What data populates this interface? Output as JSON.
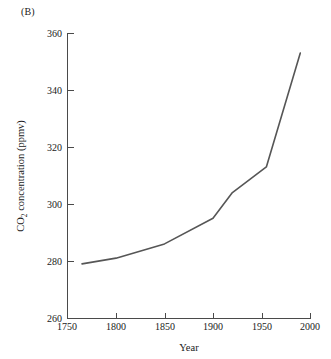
{
  "figure": {
    "panel_label": "(B)",
    "line_color": "#565656",
    "axis_color": "#4a4a4a",
    "background_color": "#ffffff"
  },
  "axes": {
    "y_label_prefix": "CO",
    "y_label_subscript": "2",
    "y_label_suffix": " concentration (ppmv)",
    "y_label_full": "CO2 concentration (ppmv)",
    "x_label": "Year",
    "y_ticks": [
      "260",
      "280",
      "300",
      "320",
      "340",
      "360"
    ],
    "x_ticks": [
      "1750",
      "1800",
      "1850",
      "1900",
      "1950",
      "2000"
    ]
  },
  "chart_data": {
    "type": "line",
    "title": "(B)",
    "xlabel": "Year",
    "ylabel": "CO2 concentration (ppmv)",
    "xlim": [
      1750,
      2000
    ],
    "ylim": [
      260,
      360
    ],
    "xticks": [
      1750,
      1800,
      1850,
      1900,
      1950,
      2000
    ],
    "yticks": [
      260,
      280,
      300,
      320,
      340,
      360
    ],
    "grid": false,
    "legend": false,
    "series": [
      {
        "name": "CO2 concentration",
        "color": "#565656",
        "x": [
          1765,
          1800,
          1850,
          1900,
          1920,
          1955,
          1990
        ],
        "values": [
          279,
          281,
          286,
          295,
          304,
          313,
          353
        ]
      }
    ]
  }
}
